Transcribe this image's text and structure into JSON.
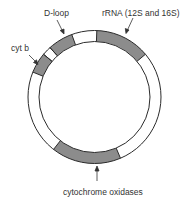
{
  "diagram": {
    "colors": {
      "outline": "#2b2b2b",
      "gene_fill": "#8c8c8c",
      "background": "#ffffff",
      "text": "#333333"
    },
    "geometry": {
      "cx": 94.5,
      "cy": 97,
      "outer_r": 66.5,
      "inner_r": 55.5
    },
    "segments": [
      {
        "name": "cyt b",
        "start_deg": 292,
        "end_deg": 310,
        "filled": true
      },
      {
        "name": "gap",
        "start_deg": 310,
        "end_deg": 318,
        "filled": false
      },
      {
        "name": "D-loop",
        "start_deg": 318,
        "end_deg": 340,
        "filled": true
      },
      {
        "name": "rRNA (12S and 16S)",
        "start_deg": 2,
        "end_deg": 50,
        "filled": true
      },
      {
        "name": "cytochrome oxidases",
        "start_deg": 157,
        "end_deg": 218,
        "filled": true
      }
    ],
    "labels": [
      {
        "id": "cytb",
        "text": "cyt b",
        "x": 11,
        "y": 51
      },
      {
        "id": "dloop",
        "text": "D-loop",
        "x": 44,
        "y": 16
      },
      {
        "id": "rrna",
        "text": "rRNA (12S and 16S)",
        "x": 102,
        "y": 16
      },
      {
        "id": "cox",
        "text": "cytochrome oxidases",
        "x": 63,
        "y": 195
      }
    ]
  }
}
